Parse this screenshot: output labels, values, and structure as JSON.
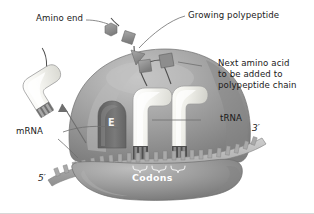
{
  "figure": {
    "labels": {
      "amino_end": "Amino end",
      "growing_polypeptide": "Growing polypeptide",
      "next_amino_acid_line1": "Next amino acid",
      "next_amino_acid_line2": "to be added to",
      "next_amino_acid_line3": "polypeptide chain",
      "mrna": "mRNA",
      "trna": "tRNA",
      "codons": "Codons",
      "e_site": "E",
      "five_prime": "5′",
      "three_prime": "3′"
    },
    "colors": {
      "ribosome_large_subunit": "#9a9a9a",
      "ribosome_small_subunit": "#8e8e8e",
      "trna_body": "#f2f2ee",
      "amino_acid_shape": "#8c8c8c",
      "mrna_strand": "#b5b5b5",
      "e_site_slot": "#6b6b6b",
      "leader_line": "#6e6e6e",
      "label_text": "#1a1a1a",
      "codons_text": "#ffffff",
      "background": "#ffffff"
    },
    "structures": {
      "amino_acid_count": 6,
      "trna_in_ribosome_count": 2,
      "trna_departing_count": 1,
      "codon_brackets": 2,
      "sites_shown": [
        "E"
      ]
    }
  }
}
